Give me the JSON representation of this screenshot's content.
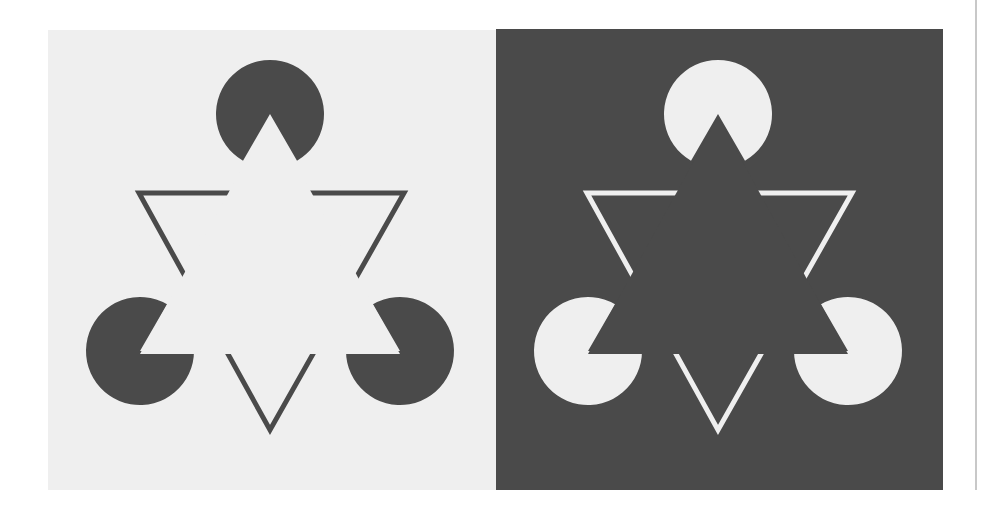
{
  "figure": {
    "colors": {
      "light": "#efefef",
      "dark": "#4a4a4a",
      "page": "#ffffff",
      "divider": "#c8c8c8"
    },
    "panels": [
      {
        "id": "light-panel",
        "x": 48,
        "y": 30,
        "width": 448,
        "height": 460,
        "background": "#efefef",
        "foreground": "#4a4a4a",
        "pacmen": [
          {
            "cx": 222,
            "cy": 84,
            "r": 54,
            "mouth_deg": 60,
            "mouth_direction_deg": 90
          },
          {
            "cx": 92,
            "cy": 321,
            "r": 54,
            "mouth_deg": 60,
            "mouth_direction_deg": -30
          },
          {
            "cx": 352,
            "cy": 321,
            "r": 54,
            "mouth_deg": 60,
            "mouth_direction_deg": 210
          }
        ],
        "outline_triangle": {
          "vertices": [
            [
              91,
              163
            ],
            [
              356,
              163
            ],
            [
              222,
              400
            ]
          ],
          "stroke_width": 5
        }
      },
      {
        "id": "dark-panel",
        "x": 496,
        "y": 29,
        "width": 447,
        "height": 461,
        "background": "#4a4a4a",
        "foreground": "#efefef",
        "pacmen": [
          {
            "cx": 222,
            "cy": 85,
            "r": 54,
            "mouth_deg": 60,
            "mouth_direction_deg": 90
          },
          {
            "cx": 92,
            "cy": 322,
            "r": 54,
            "mouth_deg": 60,
            "mouth_direction_deg": -30
          },
          {
            "cx": 352,
            "cy": 322,
            "r": 54,
            "mouth_deg": 60,
            "mouth_direction_deg": 210
          }
        ],
        "outline_triangle": {
          "vertices": [
            [
              91,
              164
            ],
            [
              356,
              164
            ],
            [
              222,
              401
            ]
          ],
          "stroke_width": 5
        }
      }
    ]
  }
}
